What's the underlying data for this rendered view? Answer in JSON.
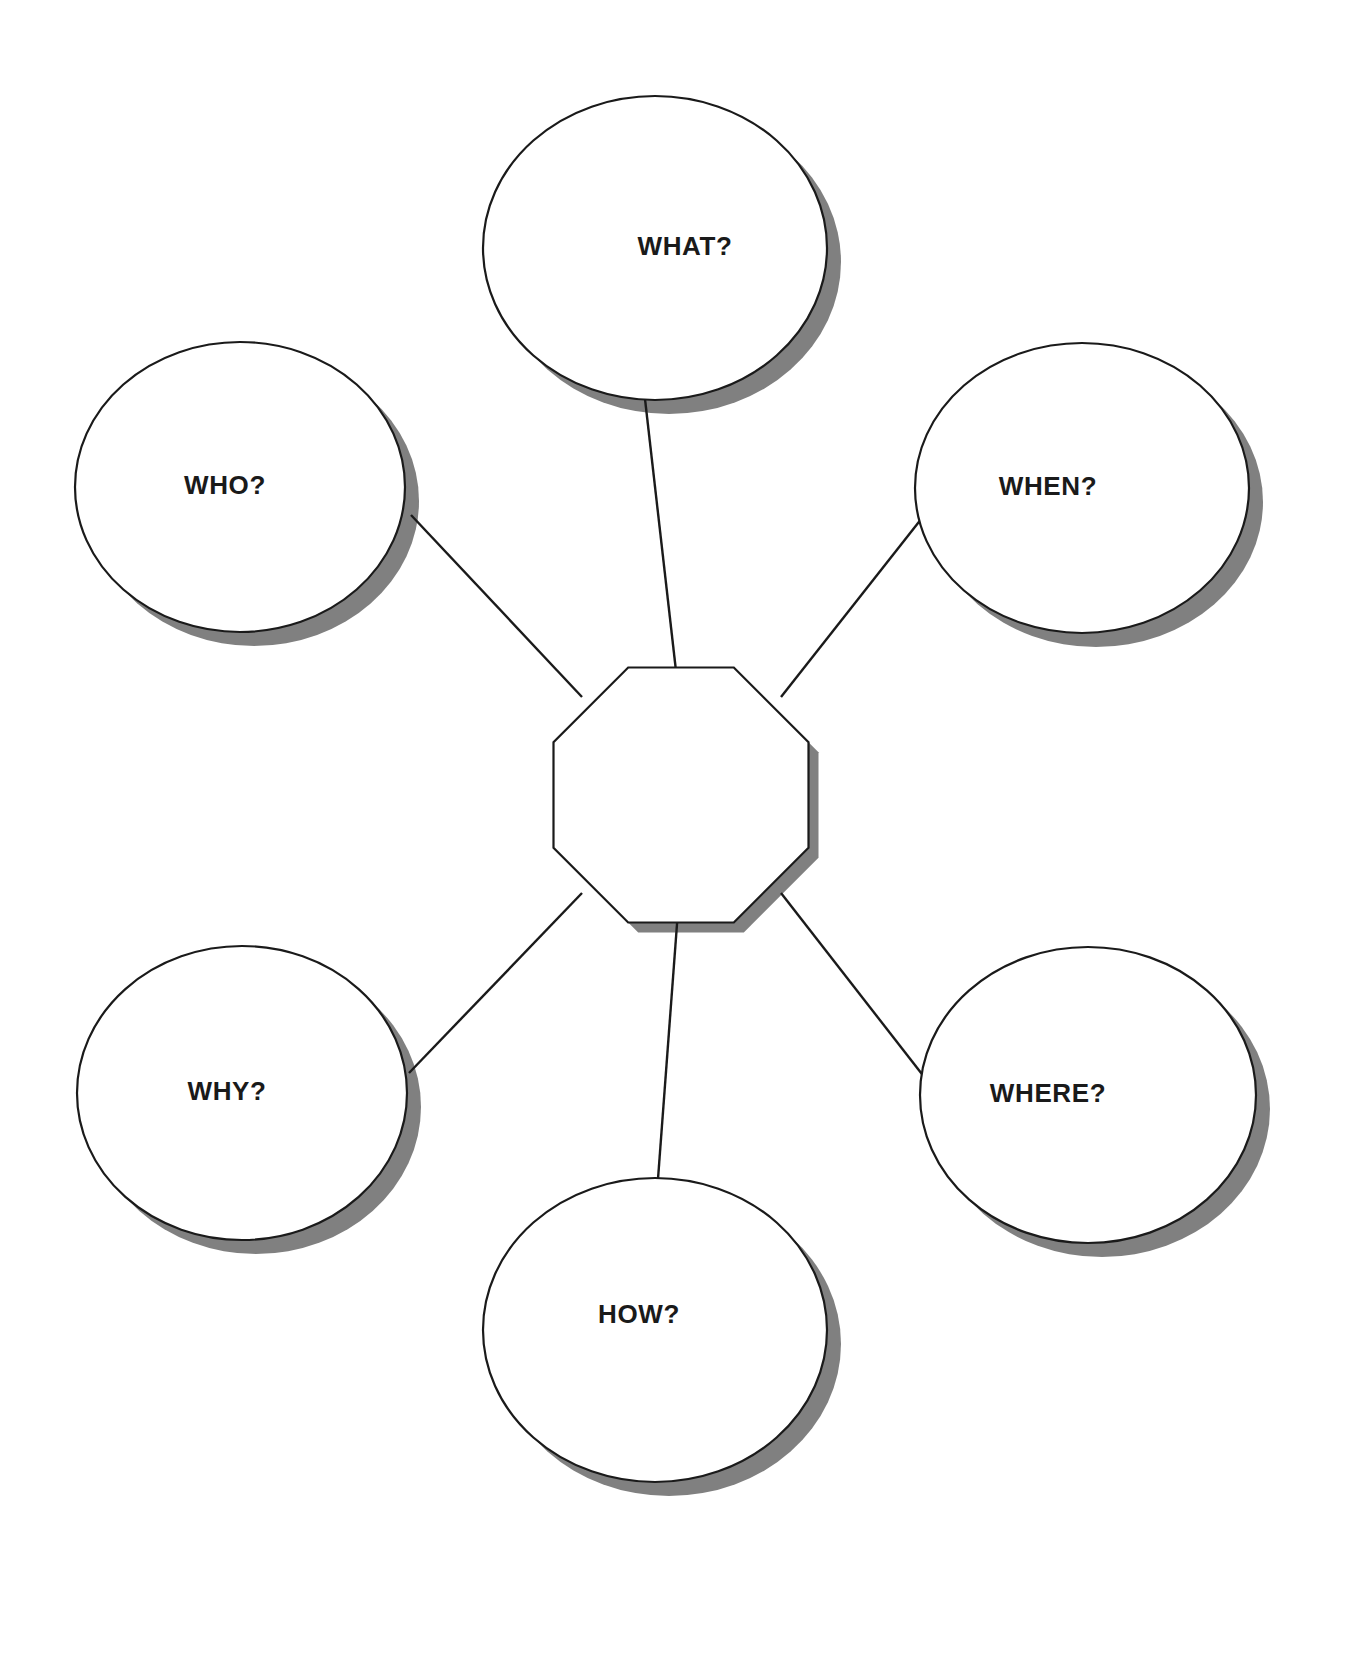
{
  "document": {
    "title": "5W1H Graphic Organizer",
    "background_color": "#ffffff",
    "width": 1366,
    "height": 1674
  },
  "style": {
    "outline_color": "#1a1a1a",
    "fill_color": "#ffffff",
    "shadow_color": "#808080",
    "text_color": "#1a1a1a",
    "shadow_offset_x": 14,
    "shadow_offset_y": 14,
    "stroke_width": 2.2,
    "label_font_size": 26
  },
  "center": {
    "name": "center-octagon",
    "label": "",
    "shape": "octagon",
    "cx": 681,
    "cy": 795,
    "radius": 138,
    "shadow_offset_x": 10,
    "shadow_offset_y": 10
  },
  "nodes": [
    {
      "id": "what",
      "label": "WHAT?",
      "shape": "ellipse",
      "cx": 655,
      "cy": 248,
      "rx": 172,
      "ry": 152,
      "label_dx": 30,
      "label_dy": 0
    },
    {
      "id": "who",
      "label": "WHO?",
      "shape": "ellipse",
      "cx": 240,
      "cy": 487,
      "rx": 165,
      "ry": 145,
      "label_dx": -15,
      "label_dy": 0
    },
    {
      "id": "when",
      "label": "WHEN?",
      "shape": "ellipse",
      "cx": 1082,
      "cy": 488,
      "rx": 167,
      "ry": 145,
      "label_dx": -34,
      "label_dy": 0
    },
    {
      "id": "why",
      "label": "WHY?",
      "shape": "ellipse",
      "cx": 242,
      "cy": 1093,
      "rx": 165,
      "ry": 147,
      "label_dx": -15,
      "label_dy": 0
    },
    {
      "id": "where",
      "label": "WHERE?",
      "shape": "ellipse",
      "cx": 1088,
      "cy": 1095,
      "rx": 168,
      "ry": 148,
      "label_dx": -40,
      "label_dy": 0
    },
    {
      "id": "how",
      "label": "HOW?",
      "shape": "ellipse",
      "cx": 655,
      "cy": 1330,
      "rx": 172,
      "ry": 152,
      "label_dx": -16,
      "label_dy": -14
    }
  ],
  "connectors": [
    {
      "id": "center-to-what",
      "from": "center-octagon",
      "to": "what",
      "x1": 680,
      "y1": 706,
      "x2": 645,
      "y2": 399
    },
    {
      "id": "center-to-who",
      "from": "center-octagon",
      "to": "who",
      "x1": 582,
      "y1": 697,
      "x2": 411,
      "y2": 515
    },
    {
      "id": "center-to-when",
      "from": "center-octagon",
      "to": "when",
      "x1": 781,
      "y1": 697,
      "x2": 922,
      "y2": 518
    },
    {
      "id": "center-to-why",
      "from": "center-octagon",
      "to": "why",
      "x1": 582,
      "y1": 893,
      "x2": 409,
      "y2": 1073
    },
    {
      "id": "center-to-where",
      "from": "center-octagon",
      "to": "where",
      "x1": 781,
      "y1": 893,
      "x2": 925,
      "y2": 1078
    },
    {
      "id": "center-to-how",
      "from": "center-octagon",
      "to": "how",
      "x1": 680,
      "y1": 884,
      "x2": 658,
      "y2": 1179
    }
  ]
}
